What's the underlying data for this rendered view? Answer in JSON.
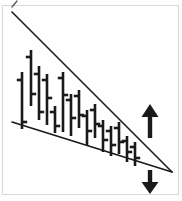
{
  "figure": {
    "width": 182,
    "height": 201,
    "background_color": "#ffffff",
    "ink_color": "#1a1a1a",
    "frame_color": "#d8d8d8",
    "pattern_name": "descending-wedge",
    "caption": ""
  },
  "chart_data": {
    "type": "ohlc-bar",
    "title": "",
    "subtitle": "",
    "xlabel": "",
    "ylabel": "",
    "grid": false,
    "legend": false,
    "xlim": [
      0,
      182
    ],
    "ylim": [
      0,
      201
    ],
    "axis_units": "pixels",
    "bars": [
      {
        "index": 1,
        "x": 22,
        "high": 72,
        "low": 129,
        "open": 80,
        "close": 122
      },
      {
        "index": 2,
        "x": 31,
        "high": 50,
        "low": 106,
        "open": 57,
        "close": 94
      },
      {
        "index": 3,
        "x": 39,
        "high": 66,
        "low": 120,
        "open": 74,
        "close": 112
      },
      {
        "index": 4,
        "x": 47,
        "high": 74,
        "low": 125,
        "open": 80,
        "close": 98
      },
      {
        "index": 5,
        "x": 55,
        "high": 106,
        "low": 133,
        "open": 112,
        "close": 126
      },
      {
        "index": 6,
        "x": 63,
        "high": 72,
        "low": 132,
        "open": 78,
        "close": 95
      },
      {
        "index": 7,
        "x": 71,
        "high": 94,
        "low": 136,
        "open": 100,
        "close": 118
      },
      {
        "index": 8,
        "x": 79,
        "high": 90,
        "low": 128,
        "open": 96,
        "close": 115
      },
      {
        "index": 9,
        "x": 87,
        "high": 110,
        "low": 145,
        "open": 116,
        "close": 131
      },
      {
        "index": 10,
        "x": 95,
        "high": 104,
        "low": 138,
        "open": 110,
        "close": 124
      },
      {
        "index": 11,
        "x": 103,
        "high": 120,
        "low": 152,
        "open": 126,
        "close": 140
      },
      {
        "index": 12,
        "x": 111,
        "high": 126,
        "low": 156,
        "open": 131,
        "close": 145
      },
      {
        "index": 13,
        "x": 119,
        "high": 122,
        "low": 154,
        "open": 128,
        "close": 142
      },
      {
        "index": 14,
        "x": 127,
        "high": 136,
        "low": 162,
        "open": 141,
        "close": 152
      },
      {
        "index": 15,
        "x": 135,
        "high": 142,
        "low": 166,
        "open": 147,
        "close": 158
      }
    ],
    "trendlines": [
      {
        "name": "upper-resistance-line",
        "x1": 12,
        "y1": 12,
        "x2": 172,
        "y2": 172
      },
      {
        "name": "lower-support-line",
        "x1": 12,
        "y1": 122,
        "x2": 172,
        "y2": 172
      }
    ],
    "annotations": [
      {
        "name": "breakout-up-arrow",
        "direction": "up",
        "x": 150,
        "y_top": 104,
        "y_bottom": 138
      },
      {
        "name": "breakout-down-arrow",
        "direction": "down",
        "x": 150,
        "y_top": 170,
        "y_bottom": 194
      },
      {
        "name": "corner-tick-mark",
        "direction": "tick",
        "x": 14,
        "y_top": 1,
        "y_bottom": 7
      }
    ]
  }
}
